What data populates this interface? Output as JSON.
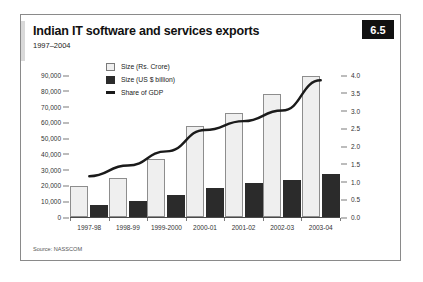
{
  "figure": {
    "number": "6.5",
    "title": "Indian IT software and services exports",
    "subtitle": "1997–2004",
    "source": "Source: NASSCOM"
  },
  "legend": {
    "items": [
      {
        "label": "Size (Rs. Crore)",
        "swatch": "light-square"
      },
      {
        "label": "Size (US $ billion)",
        "swatch": "dark-square"
      },
      {
        "label": "Share of GDP",
        "swatch": "black-line"
      }
    ]
  },
  "chart_data": {
    "type": "bar",
    "title": "Indian IT software and services exports",
    "subtitle": "1997–2004",
    "categories": [
      "1997-98",
      "1998-99",
      "1999-2000",
      "2000-01",
      "2001-02",
      "2002-03",
      "2003-04"
    ],
    "series": [
      {
        "name": "Size (Rs. Crore)",
        "type": "bar",
        "axis": "left",
        "values": [
          19600,
          24700,
          36800,
          57700,
          65900,
          78000,
          89400
        ]
      },
      {
        "name": "Size (US $ billion)",
        "type": "bar",
        "axis": "right",
        "values": [
          0.35,
          0.45,
          0.62,
          0.82,
          0.95,
          1.05,
          1.2
        ]
      },
      {
        "name": "Share of GDP",
        "type": "line",
        "axis": "right",
        "values": [
          1.15,
          1.45,
          1.85,
          2.45,
          2.7,
          3.0,
          3.85
        ]
      }
    ],
    "xlabel": "",
    "ylabel": "",
    "ylim": [
      0,
      90000
    ],
    "yticks": [
      "0",
      "10,000",
      "20,000",
      "30,000",
      "40,000",
      "50,000",
      "60,000",
      "70,000",
      "80,000",
      "90,000"
    ],
    "ylim_right": [
      0,
      4.0
    ],
    "yticks_right": [
      "0.0",
      "0.5",
      "1.0",
      "1.5",
      "2.0",
      "2.5",
      "3.0",
      "3.5",
      "4.0"
    ],
    "grid": false,
    "legend_position": "top-left-inside",
    "colors": {
      "bar_light": "#efefef",
      "bar_light_border": "#8d8d8d",
      "bar_dark": "#2b2b2b",
      "line": "#1a1a1a",
      "axis": "#4a4a4a",
      "fignum_bg": "#111111"
    }
  }
}
